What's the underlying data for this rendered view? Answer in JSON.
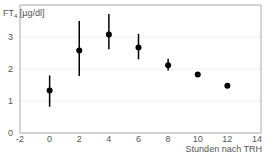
{
  "chart_data": {
    "type": "scatter",
    "title": "",
    "ylabel": "FT4 [µg/dl]",
    "ylabel_main": "FT",
    "ylabel_sub": "4",
    "ylabel_unit": " [µg/dl]",
    "xlabel": "Stunden nach TRH",
    "xlim": [
      -2,
      14
    ],
    "ylim": [
      0,
      3.9
    ],
    "xticks": [
      -2,
      0,
      2,
      4,
      6,
      8,
      10,
      12,
      14
    ],
    "yticks": [
      0,
      1,
      2,
      3
    ],
    "grid": "horizontal",
    "series": [
      {
        "name": "FT4",
        "x": [
          0,
          2,
          4,
          6,
          8,
          10,
          12
        ],
        "y": [
          1.33,
          2.58,
          3.08,
          2.67,
          2.12,
          1.83,
          1.48
        ],
        "err_low": [
          0.82,
          1.78,
          2.62,
          2.3,
          1.95,
          1.83,
          1.48
        ],
        "err_high": [
          1.8,
          3.5,
          3.72,
          3.1,
          2.32,
          1.83,
          1.48
        ]
      }
    ],
    "colors": {
      "marker": "#000000",
      "axis": "#999999",
      "grid": "#eeeeee",
      "text": "#555555"
    }
  }
}
